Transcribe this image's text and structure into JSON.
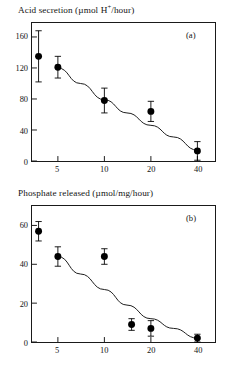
{
  "figure": {
    "background_color": "#ffffff",
    "ink_color": "#1a1a1a",
    "marker_color": "#000000"
  },
  "chart_data": [
    {
      "type": "scatter",
      "panel_tag": "(a)",
      "title": "Acid secretion (µmol H⁺/hour)",
      "title_prefix": "Acid secretion (µmol H",
      "title_superscript": "+",
      "title_suffix": "/hour)",
      "xlabel": "",
      "ylabel": "",
      "xscale": "log",
      "xlim": [
        3.4,
        52
      ],
      "ylim": [
        0,
        178
      ],
      "grid": false,
      "legend": "none",
      "xticks": [
        5,
        10,
        20,
        40
      ],
      "xtick_labels": [
        "5",
        "10",
        "20",
        "40"
      ],
      "yticks": [
        0,
        40,
        80,
        120,
        160
      ],
      "ytick_labels": [
        "0",
        "40",
        "80",
        "120",
        "160"
      ],
      "points": [
        {
          "x": 3.75,
          "y": 135,
          "err": 33
        },
        {
          "x": 5,
          "y": 121,
          "err": 14
        },
        {
          "x": 10,
          "y": 78,
          "err": 16
        },
        {
          "x": 20,
          "y": 64,
          "err": 13
        },
        {
          "x": 40,
          "y": 13,
          "err": 12
        }
      ],
      "fit_curve": [
        {
          "x": 5,
          "y": 120
        },
        {
          "x": 7,
          "y": 100
        },
        {
          "x": 10,
          "y": 79
        },
        {
          "x": 14,
          "y": 62
        },
        {
          "x": 20,
          "y": 46
        },
        {
          "x": 28,
          "y": 31
        },
        {
          "x": 40,
          "y": 14
        }
      ]
    },
    {
      "type": "scatter",
      "panel_tag": "(b)",
      "title": "Phosphate released (µmol/mg/hour)",
      "title_prefix": "Phosphate released (µmol/mg/hour)",
      "title_superscript": "",
      "title_suffix": "",
      "xlabel": "",
      "ylabel": "",
      "xscale": "log",
      "xlim": [
        3.4,
        52
      ],
      "ylim": [
        0,
        70
      ],
      "grid": false,
      "legend": "none",
      "xticks": [
        5,
        10,
        20,
        40
      ],
      "xtick_labels": [
        "5",
        "10",
        "20",
        "40"
      ],
      "yticks": [
        0,
        20,
        40,
        60
      ],
      "ytick_labels": [
        "0",
        "20",
        "40",
        "60"
      ],
      "points": [
        {
          "x": 3.75,
          "y": 57,
          "err": 5
        },
        {
          "x": 5,
          "y": 44,
          "err": 5
        },
        {
          "x": 10,
          "y": 44,
          "err": 4
        },
        {
          "x": 15,
          "y": 9,
          "err": 3
        },
        {
          "x": 20,
          "y": 7,
          "err": 4
        },
        {
          "x": 40,
          "y": 2,
          "err": 2
        }
      ],
      "fit_curve": [
        {
          "x": 5,
          "y": 44
        },
        {
          "x": 7,
          "y": 35
        },
        {
          "x": 10,
          "y": 27
        },
        {
          "x": 14,
          "y": 19
        },
        {
          "x": 20,
          "y": 12
        },
        {
          "x": 28,
          "y": 7
        },
        {
          "x": 40,
          "y": 2
        }
      ]
    }
  ]
}
